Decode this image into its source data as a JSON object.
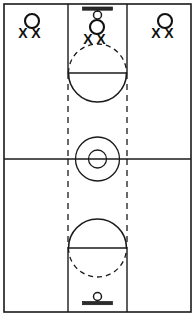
{
  "diagram": {
    "type": "basketball-full-court-vertical",
    "orientation": "vertical",
    "background_color": "#ffffff",
    "line_color": "#1a1a1a",
    "marker_color": "#111111"
  },
  "court": {
    "boundary": {
      "x": 4,
      "y": 4,
      "width": 187,
      "height": 308
    },
    "halfcourt_line": {
      "y": 159,
      "x1": 4,
      "x2": 191
    },
    "center_circle": {
      "cx": 97.5,
      "cy": 159,
      "r_outer": 22,
      "r_inner": 9
    },
    "lane_left_x": 68,
    "lane_right_x": 127
  },
  "top_basket": {
    "label": "top-basket",
    "backboard": {
      "cx": 97.5,
      "y": 8,
      "width": 30,
      "thickness": 3
    },
    "hoop": {
      "cx": 97.5,
      "cy": 15,
      "r": 4
    },
    "free_throw_line_y": 73,
    "solid_arc": "below-free-throw-line",
    "dashed_arc": "above-free-throw-line",
    "arc_radius": 29,
    "lane_solid_to_y": 73,
    "lane_dashed_from_y": 73,
    "lane_dashed_to_y": 159
  },
  "bottom_basket": {
    "label": "bottom-basket",
    "backboard": {
      "cx": 97.5,
      "y": 303,
      "width": 30,
      "thickness": 3
    },
    "hoop": {
      "cx": 97.5,
      "cy": 296,
      "r": 4
    },
    "free_throw_line_y": 248,
    "solid_arc": "above-free-throw-line",
    "dashed_arc": "below-free-throw-line",
    "arc_radius": 29,
    "lane_solid_to_y": 248,
    "lane_dashed_from_y": 248,
    "lane_dashed_to_y": 159
  },
  "player_groups": [
    {
      "id": "group-left",
      "name": "left-player-group",
      "offense": {
        "symbol": "O",
        "cx": 32,
        "cy": 21,
        "r": 7
      },
      "defenders": [
        {
          "symbol": "X",
          "x": 23,
          "y": 38
        },
        {
          "symbol": "X",
          "x": 36,
          "y": 38
        }
      ]
    },
    {
      "id": "group-center",
      "name": "center-player-group",
      "offense": {
        "symbol": "O",
        "cx": 97,
        "cy": 27,
        "r": 7
      },
      "defenders": [
        {
          "symbol": "X",
          "x": 88,
          "y": 44
        },
        {
          "symbol": "X",
          "x": 101,
          "y": 44
        }
      ]
    },
    {
      "id": "group-right",
      "name": "right-player-group",
      "offense": {
        "symbol": "O",
        "cx": 165,
        "cy": 21,
        "r": 7
      },
      "defenders": [
        {
          "symbol": "X",
          "x": 156,
          "y": 38
        },
        {
          "symbol": "X",
          "x": 169,
          "y": 38
        }
      ]
    }
  ]
}
